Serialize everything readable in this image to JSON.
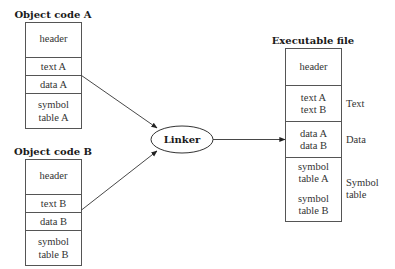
{
  "diagram": {
    "object_a": {
      "title": "Object code A",
      "sections": [
        "header",
        "text A",
        "data A",
        "symbol",
        "table A"
      ]
    },
    "object_b": {
      "title": "Object code B",
      "sections": [
        "header",
        "text B",
        "data B",
        "symbol",
        "table B"
      ]
    },
    "linker": {
      "label": "Linker"
    },
    "executable": {
      "title": "Executable file",
      "header": "header",
      "text_lines": [
        "text A",
        "text B"
      ],
      "data_lines": [
        "data A",
        "data B"
      ],
      "symbol_lines": [
        "symbol",
        "table A",
        "symbol",
        "table B"
      ],
      "side_labels": {
        "text": "Text",
        "data": "Data",
        "symbol_1": "Symbol",
        "symbol_2": "table"
      }
    },
    "edges": [
      {
        "from": "object_a.data",
        "to": "linker"
      },
      {
        "from": "object_b.data",
        "to": "linker"
      },
      {
        "from": "linker",
        "to": "executable.data"
      }
    ]
  }
}
